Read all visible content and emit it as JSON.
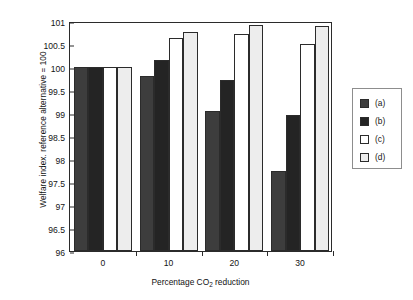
{
  "chart_data": {
    "type": "bar",
    "title": "",
    "xlabel_prefix": "Percentage CO",
    "xlabel_sub": "2",
    "xlabel_suffix": " reduction",
    "xlabel": "Percentage CO2 reduction",
    "ylabel": "Welfare index. reference alternative = 100",
    "categories": [
      "0",
      "10",
      "20",
      "30"
    ],
    "ylim": [
      96,
      101
    ],
    "yticks": [
      "96",
      "96.5",
      "97",
      "97.5",
      "98",
      "98.5",
      "99",
      "99.5",
      "100",
      "100.5",
      "101"
    ],
    "ytick_values": [
      96,
      96.5,
      97,
      97.5,
      98,
      98.5,
      99,
      99.5,
      100,
      100.5,
      101
    ],
    "grid": false,
    "legend_position": "right-outside",
    "series": [
      {
        "name": "(a)",
        "color": "#3d3d3d",
        "values": [
          100,
          99.8,
          99.05,
          97.75
        ]
      },
      {
        "name": "(b)",
        "color": "#242424",
        "values": [
          100,
          100.15,
          99.72,
          98.95
        ]
      },
      {
        "name": "(c)",
        "color": "#ffffff",
        "values": [
          100,
          100.62,
          100.72,
          100.5
        ]
      },
      {
        "name": "(d)",
        "color": "#ededed",
        "values": [
          100,
          100.76,
          100.92,
          100.9
        ]
      }
    ]
  }
}
